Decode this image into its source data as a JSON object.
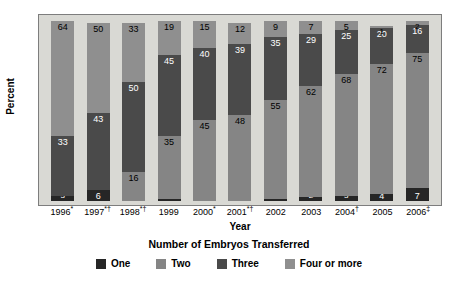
{
  "chart_data": {
    "type": "bar",
    "stacked": true,
    "title": "",
    "subtitle": "Number of Embryos Transferred",
    "xlabel": "Year",
    "ylabel": "Percent",
    "ylim": [
      0,
      100
    ],
    "grid": false,
    "legend_position": "bottom",
    "categories": [
      "1996*",
      "1997*†",
      "1998*†",
      "1999",
      "2000*",
      "2001*†",
      "2002",
      "2003",
      "2004†",
      "2005",
      "2006‡"
    ],
    "series": [
      {
        "name": "One",
        "color": "#262626",
        "values": [
          3,
          6,
          0,
          1,
          0,
          0,
          1,
          2,
          3,
          4,
          7
        ]
      },
      {
        "name": "Two",
        "color": "#858585",
        "values": [
          0,
          0,
          16,
          35,
          45,
          48,
          55,
          62,
          68,
          72,
          75
        ]
      },
      {
        "name": "Three",
        "color": "#4a4a4a",
        "values": [
          33,
          43,
          50,
          45,
          40,
          39,
          35,
          29,
          25,
          20,
          16
        ]
      },
      {
        "name": "Four or more",
        "color": "#8f8f8f",
        "values": [
          64,
          50,
          33,
          19,
          15,
          12,
          9,
          7,
          5,
          1,
          2
        ]
      }
    ]
  },
  "legend": {
    "items": [
      {
        "label": "One",
        "color": "#262626"
      },
      {
        "label": "Two",
        "color": "#858585"
      },
      {
        "label": "Three",
        "color": "#4a4a4a"
      },
      {
        "label": "Four or more",
        "color": "#8f8f8f"
      }
    ]
  },
  "axes": {
    "y_title": "Percent",
    "x_title": "Year"
  },
  "figure": {
    "subtitle": "Number of Embryos Transferred",
    "plot_background": "#d9d9d4",
    "page_background": "#ffffff",
    "border_color": "#7d7d7d"
  },
  "label_text_colors": {
    "on_light": "#000000",
    "on_dark": "#ffffff"
  }
}
